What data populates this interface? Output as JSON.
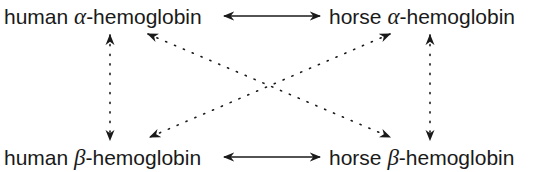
{
  "nodes": {
    "top_left": {
      "prefix": "human ",
      "greek": "α",
      "suffix": "-hemoglobin"
    },
    "top_right": {
      "prefix": "horse ",
      "greek": "α",
      "suffix": "-hemoglobin"
    },
    "bottom_left": {
      "prefix": "human ",
      "greek": "β",
      "suffix": "-hemoglobin"
    },
    "bottom_right": {
      "prefix": "horse ",
      "greek": "β",
      "suffix": "-hemoglobin"
    }
  },
  "edges": [
    {
      "from": "top_left",
      "to": "top_right",
      "style": "solid",
      "direction": "both"
    },
    {
      "from": "bottom_left",
      "to": "bottom_right",
      "style": "solid",
      "direction": "both"
    },
    {
      "from": "top_left",
      "to": "bottom_left",
      "style": "dotted",
      "direction": "both"
    },
    {
      "from": "top_right",
      "to": "bottom_right",
      "style": "dotted",
      "direction": "both"
    },
    {
      "from": "top_left",
      "to": "bottom_right",
      "style": "dotted",
      "direction": "both"
    },
    {
      "from": "top_right",
      "to": "bottom_left",
      "style": "dotted",
      "direction": "both"
    }
  ],
  "colors": {
    "ink": "#1a1a1a",
    "background": "#ffffff"
  }
}
